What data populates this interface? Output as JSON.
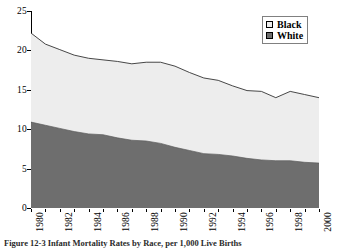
{
  "chart_data": {
    "type": "area",
    "stacked": true,
    "title": "",
    "subtitle": "",
    "xlabel": "",
    "ylabel": "",
    "xlim": [
      1980,
      2000
    ],
    "ylim": [
      0,
      25
    ],
    "grid": false,
    "legend_position": "top-right",
    "x": [
      1980,
      1981,
      1982,
      1983,
      1984,
      1985,
      1986,
      1987,
      1988,
      1989,
      1990,
      1991,
      1992,
      1993,
      1994,
      1995,
      1996,
      1997,
      1998,
      1999,
      2000
    ],
    "x_tick_labels": [
      "1980",
      "1982",
      "1984",
      "1986",
      "1988",
      "1990",
      "1992",
      "1994",
      "1996",
      "1998",
      "2000"
    ],
    "y_tick_labels": [
      "0",
      "5",
      "10",
      "15",
      "20",
      "25"
    ],
    "y_ticks": [
      0,
      5,
      10,
      15,
      20,
      25
    ],
    "series": [
      {
        "name": "White",
        "color": "#6e6e6e",
        "values": [
          10.9,
          10.5,
          10.1,
          9.7,
          9.4,
          9.3,
          8.9,
          8.6,
          8.5,
          8.2,
          7.7,
          7.3,
          6.9,
          6.8,
          6.6,
          6.3,
          6.1,
          6.0,
          6.0,
          5.8,
          5.7
        ]
      },
      {
        "name": "Black",
        "color": "#ededed",
        "values": [
          11.3,
          10.3,
          10.0,
          9.7,
          9.6,
          9.5,
          9.7,
          9.7,
          10.0,
          10.3,
          10.3,
          9.9,
          9.6,
          9.4,
          8.9,
          8.6,
          8.7,
          8.0,
          8.8,
          8.6,
          8.3
        ]
      }
    ],
    "total": [
      22.2,
      20.8,
      20.1,
      19.4,
      19.0,
      18.8,
      18.6,
      18.3,
      18.5,
      18.5,
      18.0,
      17.2,
      16.5,
      16.2,
      15.5,
      14.9,
      14.8,
      14.0,
      14.8,
      14.4,
      14.0
    ]
  },
  "legend": {
    "items": [
      {
        "label": "Black",
        "swatch": "#ededed"
      },
      {
        "label": "White",
        "swatch": "#6e6e6e"
      }
    ]
  },
  "caption": {
    "text": "Figure 12-3 Infant Mortality Rates by Race, per 1,000 Live Births"
  }
}
